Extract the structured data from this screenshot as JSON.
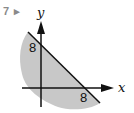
{
  "question": {
    "number": "7",
    "marker": "▸"
  },
  "diagram": {
    "x_axis_label": "x",
    "y_axis_label": "y",
    "x_intercept_label": "8",
    "y_intercept_label": "8",
    "line": "x + y = 8",
    "shaded_region": "below/left of line x + y = 8",
    "colors": {
      "shade": "#c8c8c8",
      "lines": "#111111",
      "question_number": "#8a8a8a"
    }
  }
}
